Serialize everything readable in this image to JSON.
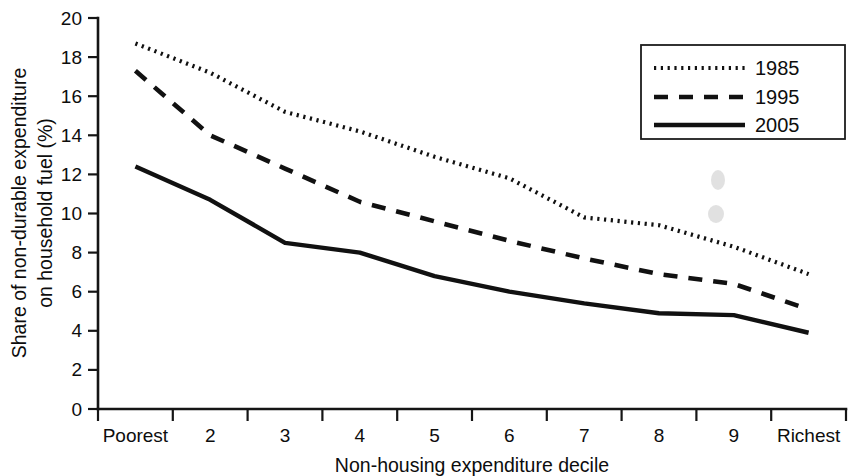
{
  "chart_data": {
    "type": "line",
    "title": "",
    "xlabel": "Non-housing expenditure decile",
    "ylabel": "Share of non-durable expenditure on household fuel (%)",
    "categories": [
      "Poorest",
      "2",
      "3",
      "4",
      "5",
      "6",
      "7",
      "8",
      "9",
      "Richest"
    ],
    "xtick_labels": [
      "Poorest",
      "2",
      "3",
      "4",
      "5",
      "6",
      "7",
      "8",
      "9",
      "Richest"
    ],
    "ytick_labels": [
      "0",
      "2",
      "4",
      "6",
      "8",
      "10",
      "12",
      "14",
      "16",
      "18",
      "20"
    ],
    "ytick_values": [
      0,
      2,
      4,
      6,
      8,
      10,
      12,
      14,
      16,
      18,
      20
    ],
    "ylim": [
      0,
      20
    ],
    "grid": false,
    "legend_position": "top-right",
    "legend_entries": [
      "1985",
      "1995",
      "2005"
    ],
    "series": [
      {
        "name": "1985",
        "style": "dotted",
        "color": "#111111",
        "values": [
          18.7,
          17.2,
          15.2,
          14.2,
          12.9,
          11.8,
          9.8,
          9.4,
          8.3,
          6.9
        ]
      },
      {
        "name": "1995",
        "style": "dashed",
        "color": "#111111",
        "values": [
          17.3,
          14.0,
          12.3,
          10.6,
          9.6,
          8.6,
          7.7,
          6.9,
          6.4,
          5.1
        ]
      },
      {
        "name": "2005",
        "style": "solid",
        "color": "#111111",
        "values": [
          12.4,
          10.7,
          8.5,
          8.0,
          6.8,
          6.0,
          5.4,
          4.9,
          4.8,
          3.9
        ]
      }
    ]
  },
  "axes": {
    "y_axis_label": "Share of non-durable expenditure on household fuel (%)",
    "y_axis_label_line1": "Share of non-durable expenditure",
    "y_axis_label_line2": "on household fuel (%)",
    "x_axis_label": "Non-housing expenditure decile"
  },
  "legend": {
    "items": [
      {
        "label": "1985",
        "style": "dotted"
      },
      {
        "label": "1995",
        "style": "dashed"
      },
      {
        "label": "2005",
        "style": "solid"
      }
    ]
  }
}
